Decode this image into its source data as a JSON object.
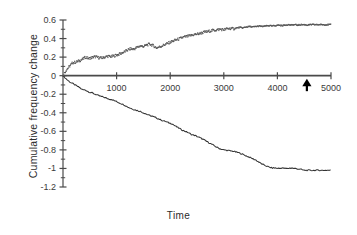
{
  "chart_data": {
    "type": "line",
    "title": "",
    "xlabel": "Time",
    "ylabel": "Cumulative frequency change",
    "xlim": [
      0,
      5000
    ],
    "ylim": [
      -1.2,
      0.6
    ],
    "grid": false,
    "legend": "none",
    "xticks": [
      0,
      1000,
      2000,
      3000,
      4000,
      5000
    ],
    "xtick_labels": [
      "",
      "1000",
      "2000",
      "3000",
      "4000",
      "5000"
    ],
    "yticks": [
      0.6,
      0.4,
      0.2,
      0,
      -0.2,
      -0.4,
      -0.6,
      -0.8,
      -1,
      -1.2
    ],
    "ytick_labels": [
      "0.6",
      "0.4",
      "0.2",
      "0",
      "-0.2",
      "-0.4",
      "-0.6",
      "-0.8",
      "-1",
      "-1.2"
    ],
    "yminor_step": 0.1,
    "axis_position": "x-axis drawn at y=0",
    "annotations": [
      {
        "name": "up-arrow-marker",
        "x": 4550,
        "y": 0,
        "symbol": "▲",
        "color": "#000000",
        "description": "solid black upward arrow below x-axis"
      }
    ],
    "series": [
      {
        "name": "upper",
        "style": "dotted",
        "color": "#555555",
        "marker": "point",
        "x": [
          0,
          60,
          120,
          180,
          240,
          300,
          360,
          420,
          480,
          540,
          600,
          660,
          720,
          780,
          840,
          900,
          960,
          1020,
          1080,
          1140,
          1200,
          1260,
          1320,
          1380,
          1440,
          1500,
          1560,
          1620,
          1680,
          1740,
          1800,
          1860,
          1920,
          1980,
          2040,
          2100,
          2160,
          2220,
          2280,
          2340,
          2400,
          2460,
          2520,
          2580,
          2640,
          2700,
          2760,
          2820,
          2880,
          2940,
          3000,
          3060,
          3120,
          3180,
          3240,
          3300,
          3360,
          3420,
          3480,
          3540,
          3600,
          3660,
          3720,
          3780,
          3840,
          3900,
          3960,
          4020,
          4080,
          4140,
          4200,
          4260,
          4320,
          4380,
          4440,
          4500,
          4560,
          4620,
          4680,
          4740,
          4800,
          4860,
          4920,
          5000
        ],
        "y": [
          0.0,
          0.06,
          0.1,
          0.14,
          0.145,
          0.16,
          0.175,
          0.2,
          0.185,
          0.195,
          0.205,
          0.195,
          0.19,
          0.2,
          0.21,
          0.205,
          0.215,
          0.225,
          0.24,
          0.255,
          0.275,
          0.29,
          0.285,
          0.305,
          0.32,
          0.315,
          0.33,
          0.34,
          0.325,
          0.3,
          0.31,
          0.325,
          0.34,
          0.355,
          0.37,
          0.385,
          0.395,
          0.41,
          0.42,
          0.425,
          0.435,
          0.445,
          0.45,
          0.46,
          0.47,
          0.475,
          0.485,
          0.49,
          0.495,
          0.5,
          0.495,
          0.505,
          0.51,
          0.505,
          0.515,
          0.52,
          0.515,
          0.525,
          0.53,
          0.525,
          0.53,
          0.535,
          0.53,
          0.535,
          0.54,
          0.535,
          0.54,
          0.545,
          0.54,
          0.545,
          0.55,
          0.545,
          0.55,
          0.545,
          0.55,
          0.55,
          0.545,
          0.55,
          0.55,
          0.55,
          0.55,
          0.55,
          0.55,
          0.55
        ]
      },
      {
        "name": "lower",
        "style": "solid",
        "color": "#333333",
        "marker": "none",
        "x": [
          0,
          60,
          120,
          180,
          240,
          300,
          360,
          420,
          480,
          540,
          600,
          660,
          720,
          780,
          840,
          900,
          960,
          1020,
          1080,
          1140,
          1200,
          1260,
          1320,
          1380,
          1440,
          1500,
          1560,
          1620,
          1680,
          1740,
          1800,
          1860,
          1920,
          1980,
          2040,
          2100,
          2160,
          2220,
          2280,
          2340,
          2400,
          2460,
          2520,
          2580,
          2640,
          2700,
          2760,
          2820,
          2880,
          2940,
          3000,
          3060,
          3120,
          3180,
          3240,
          3300,
          3360,
          3420,
          3480,
          3540,
          3600,
          3660,
          3720,
          3780,
          3840,
          3900,
          3960,
          4020,
          4080,
          4140,
          4200,
          4260,
          4320,
          4380,
          4440,
          4500,
          4560,
          4620,
          4680,
          4740,
          4800,
          4860,
          4920,
          5000
        ],
        "y": [
          0.0,
          -0.035,
          -0.065,
          -0.085,
          -0.105,
          -0.125,
          -0.15,
          -0.155,
          -0.175,
          -0.185,
          -0.2,
          -0.215,
          -0.225,
          -0.235,
          -0.25,
          -0.255,
          -0.27,
          -0.285,
          -0.3,
          -0.315,
          -0.335,
          -0.35,
          -0.365,
          -0.375,
          -0.385,
          -0.4,
          -0.415,
          -0.43,
          -0.44,
          -0.455,
          -0.47,
          -0.485,
          -0.495,
          -0.51,
          -0.52,
          -0.545,
          -0.565,
          -0.585,
          -0.6,
          -0.615,
          -0.635,
          -0.645,
          -0.66,
          -0.675,
          -0.695,
          -0.715,
          -0.735,
          -0.755,
          -0.775,
          -0.79,
          -0.8,
          -0.805,
          -0.81,
          -0.815,
          -0.825,
          -0.835,
          -0.85,
          -0.865,
          -0.88,
          -0.895,
          -0.91,
          -0.935,
          -0.955,
          -0.97,
          -0.985,
          -0.995,
          -0.995,
          -1.0,
          -0.995,
          -1.0,
          -1.0,
          -0.995,
          -1.0,
          -1.005,
          -1.01,
          -1.02,
          -1.02,
          -1.02,
          -1.02,
          -1.02,
          -1.02,
          -1.02,
          -1.02,
          -1.02
        ]
      }
    ]
  },
  "colors": {
    "axis": "#4a4a4a",
    "upper_series": "#555555",
    "lower_series": "#333333",
    "marker": "#000000",
    "text": "#2b2b2b",
    "background": "#ffffff"
  }
}
